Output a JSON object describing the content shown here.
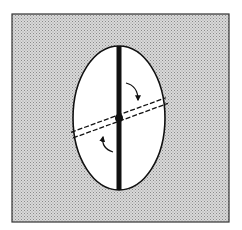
{
  "diagram": {
    "colors": {
      "background": "#ffffff",
      "frame_fill": "#c8c8c8",
      "stroke": "#111111",
      "ellipse_fill": "#ffffff"
    },
    "frame": {
      "x": 12,
      "y": 14,
      "width": 217,
      "height": 208
    },
    "ellipse": {
      "cx": 119,
      "cy": 118,
      "rx": 46,
      "ry": 72
    },
    "vertical_bar": {
      "x": 119,
      "y1": 46,
      "y2": 190,
      "width": 5
    },
    "rotated_line": {
      "angle_deg": -20,
      "style": "double-dashed"
    },
    "arrows": [
      {
        "name": "upper-right-rotation-arrow",
        "direction": "clockwise"
      },
      {
        "name": "lower-left-rotation-arrow",
        "direction": "clockwise"
      }
    ]
  }
}
